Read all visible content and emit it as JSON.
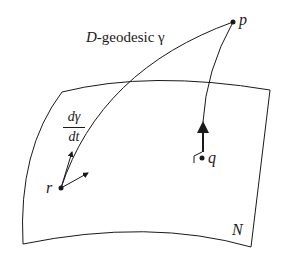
{
  "figure": {
    "labels": {
      "geodesic_prefix": "D",
      "geodesic_text": "-geodesic γ",
      "point_p": "p",
      "point_q": "q",
      "point_r": "r",
      "surface": "N",
      "tangent_numerator": "dγ",
      "tangent_denominator": "dt"
    },
    "colors": {
      "ink": "#1a1a1a",
      "background": "#ffffff"
    }
  }
}
